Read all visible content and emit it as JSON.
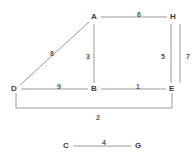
{
  "diagram": {
    "type": "weighted-graph",
    "stroke_color": "#9a9a9a",
    "label_color": "#3d3d3d",
    "weight_color": "#545454",
    "background": "#ffffff",
    "nodes": [
      {
        "id": "A",
        "label": "A",
        "x": 94,
        "y": 17
      },
      {
        "id": "H",
        "label": "H",
        "x": 173,
        "y": 17
      },
      {
        "id": "D",
        "label": "D",
        "x": 14,
        "y": 89
      },
      {
        "id": "B",
        "label": "B",
        "x": 94,
        "y": 89
      },
      {
        "id": "E",
        "label": "E",
        "x": 172,
        "y": 89
      },
      {
        "id": "C",
        "label": "C",
        "x": 66,
        "y": 146
      },
      {
        "id": "G",
        "label": "G",
        "x": 138,
        "y": 146
      }
    ],
    "edges": [
      {
        "id": "AH",
        "from": "A",
        "to": "H",
        "weight": "6",
        "label_x": 137,
        "label_y": 11,
        "x1": 101,
        "y1": 17,
        "x2": 167,
        "y2": 17
      },
      {
        "id": "AB",
        "from": "A",
        "to": "B",
        "weight": "3",
        "label_x": 86,
        "label_y": 53,
        "x1": 94,
        "y1": 24,
        "x2": 94,
        "y2": 83
      },
      {
        "id": "DA",
        "from": "D",
        "to": "A",
        "weight": "8",
        "label_x": 50,
        "label_y": 50,
        "x1": 20,
        "y1": 85,
        "x2": 89,
        "y2": 22
      },
      {
        "id": "DB",
        "from": "D",
        "to": "B",
        "weight": "9",
        "label_x": 57,
        "label_y": 83,
        "x1": 21,
        "y1": 89,
        "x2": 88,
        "y2": 89
      },
      {
        "id": "BE",
        "from": "B",
        "to": "E",
        "weight": "1",
        "label_x": 136,
        "label_y": 83,
        "x1": 101,
        "y1": 89,
        "x2": 166,
        "y2": 89
      },
      {
        "id": "HE",
        "from": "H",
        "to": "E",
        "weight": "5",
        "label_x": 161,
        "label_y": 53,
        "x1": 171,
        "y1": 24,
        "x2": 171,
        "y2": 83
      },
      {
        "id": "H7",
        "from": "H",
        "to": "E",
        "weight": "7",
        "label_x": 186,
        "label_y": 53,
        "x1": 180,
        "y1": 24,
        "x2": 180,
        "y2": 83
      },
      {
        "id": "CG",
        "from": "C",
        "to": "G",
        "weight": "4",
        "label_x": 102,
        "label_y": 139,
        "x1": 73,
        "y1": 146,
        "x2": 131,
        "y2": 146
      }
    ],
    "bracket_edge": {
      "id": "DE",
      "from": "D",
      "to": "E",
      "weight": "2",
      "label_x": 96,
      "label_y": 114,
      "path": "M 16 93 L 16 108 L 172 108 L 172 93"
    }
  }
}
